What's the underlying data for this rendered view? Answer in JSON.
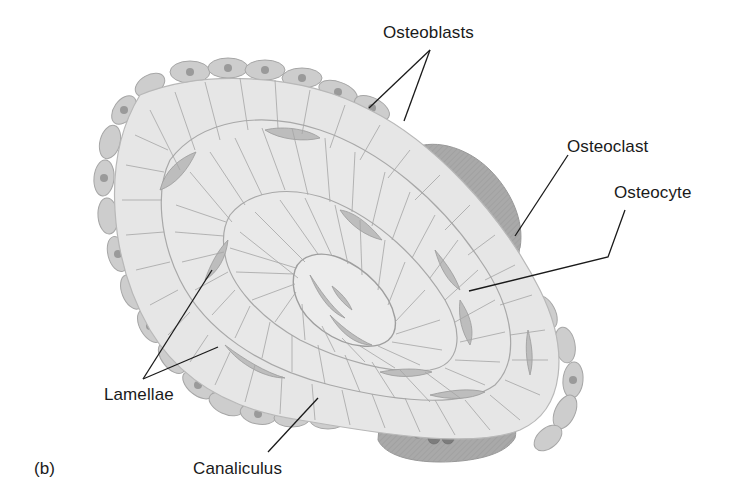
{
  "figure": {
    "panel_label": "(b)",
    "labels": {
      "osteoblasts": "Osteoblasts",
      "osteoclast": "Osteoclast",
      "osteocyte": "Osteocyte",
      "lamellae": "Lamellae",
      "canaliculus": "Canaliculus"
    },
    "colors": {
      "background": "#ffffff",
      "lamella_fill": "#e6e6e6",
      "cell_fill": "#c4c4c4",
      "osteoclast_fill": "#a8a8a8",
      "nucleus_fill": "#7a7a7a",
      "canaliculi_stroke": "#9e9e9e",
      "leader_line": "#1a1a1a",
      "text": "#1a1a1a"
    }
  }
}
